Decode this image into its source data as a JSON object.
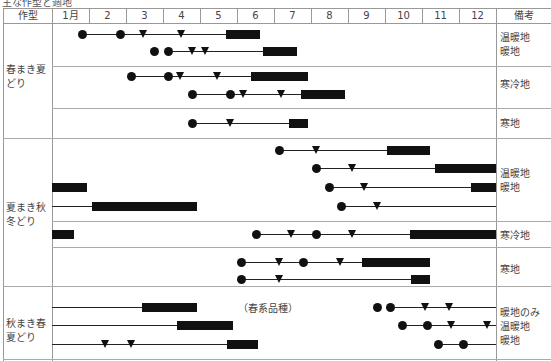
{
  "caption": "主な作型と適地",
  "header": {
    "type_col": "作型",
    "months": [
      "1月",
      "2",
      "3",
      "4",
      "5",
      "6",
      "7",
      "8",
      "9",
      "10",
      "11",
      "12"
    ],
    "notes_col": "備考"
  },
  "groups": [
    {
      "label_line1": "春まき夏",
      "label_line2": "どり"
    },
    {
      "label_line1": "夏まき秋",
      "label_line2": "冬どり"
    },
    {
      "label_line1": "秋まき春",
      "label_line2": "夏どり"
    }
  ],
  "notes": {
    "spring_warm": [
      "温暖地",
      "暖地"
    ],
    "spring_cold": "寒冷地",
    "spring_coldland": "寒地",
    "summer_warm": [
      "温暖地",
      "暖地"
    ],
    "summer_cold": "寒冷地",
    "summer_coldland": "寒地",
    "autumn": [
      "暖地のみ",
      "温暖地",
      "暖地"
    ]
  },
  "annotation": "（春系品種）",
  "chart_data": {
    "type": "table",
    "title": "主な作型と適地",
    "legend": {
      "●": "は種",
      "▼": "定植",
      "■": "収穫"
    },
    "columns": [
      "作型",
      "1月",
      "2",
      "3",
      "4",
      "5",
      "6",
      "7",
      "8",
      "9",
      "10",
      "11",
      "12",
      "備考"
    ],
    "rows": [
      {
        "group": "春まき夏どり",
        "region": "温暖地/暖地",
        "sow": [
          1.8,
          2.8
        ],
        "plant": [
          3.4,
          4.4
        ],
        "harvest": [
          5.6,
          6.5
        ]
      },
      {
        "group": "春まき夏どり",
        "region": "温暖地/暖地",
        "sow": [
          3.7,
          4.1
        ],
        "plant": [
          4.5,
          4.9
        ],
        "harvest": [
          6.6,
          7.5
        ]
      },
      {
        "group": "春まき夏どり",
        "region": "寒冷地",
        "sow": [
          3.3,
          4.3
        ],
        "plant": [
          4.6,
          5.6
        ],
        "harvest": [
          6.4,
          7.9
        ]
      },
      {
        "group": "春まき夏どり",
        "region": "寒冷地",
        "sow": [
          4.9,
          5.9
        ],
        "plant": [
          6.2,
          7.2
        ],
        "harvest": [
          7.7,
          8.9
        ]
      },
      {
        "group": "春まき夏どり",
        "region": "寒地",
        "sow": [
          4.9
        ],
        "plant": [
          5.9
        ],
        "harvest": [
          7.4,
          7.9
        ]
      },
      {
        "group": "夏まき秋冬どり",
        "region": "温暖地/暖地",
        "sow": [
          7.1
        ],
        "plant": [
          8.1
        ],
        "harvest": [
          10.0,
          11.1
        ]
      },
      {
        "group": "夏まき秋冬どり",
        "region": "温暖地/暖地",
        "sow": [
          8.1
        ],
        "plant": [
          9.0
        ],
        "harvest": [
          11.3,
          12.9
        ]
      },
      {
        "group": "夏まき秋冬どり",
        "region": "温暖地/暖地",
        "sow": [
          8.4
        ],
        "plant": [
          9.3
        ],
        "harvest": [
          12.3,
          12.9,
          1.0,
          1.9
        ]
      },
      {
        "group": "夏まき秋冬どり",
        "region": "温暖地/暖地",
        "sow": [
          8.7
        ],
        "plant": [
          9.6
        ],
        "harvest": [
          2.1,
          4.9
        ]
      },
      {
        "group": "夏まき秋冬どり",
        "region": "寒冷地",
        "sow": [
          6.3,
          7.9
        ],
        "plant": [
          7.3,
          8.9
        ],
        "harvest": [
          10.3,
          12.9,
          1.0,
          1.6
        ]
      },
      {
        "group": "夏まき秋冬どり",
        "region": "寒地",
        "sow": [
          6.0,
          7.5
        ],
        "plant": [
          6.9,
          8.4
        ],
        "harvest": [
          9.9,
          11.7
        ]
      },
      {
        "group": "夏まき秋冬どり",
        "region": "寒地",
        "sow": [
          6.0
        ],
        "plant": [
          6.9
        ],
        "harvest": [
          11.0,
          11.5
        ]
      },
      {
        "group": "秋まき春夏どり",
        "region": "暖地のみ",
        "sow": [
          9.7,
          10.1
        ],
        "plant": [
          10.8,
          11.4
        ],
        "harvest": [
          3.4,
          4.9
        ],
        "note": "（春系品種）"
      },
      {
        "group": "秋まき春夏どり",
        "region": "温暖地",
        "sow": [
          10.0,
          10.7
        ],
        "plant": [
          11.4,
          12.5
        ],
        "harvest": [
          4.3,
          5.9
        ]
      },
      {
        "group": "秋まき春夏どり",
        "region": "暖地",
        "sow": [
          11.1,
          11.7
        ],
        "plant": [
          2.4,
          3.1
        ],
        "harvest": [
          5.6,
          6.5
        ]
      }
    ]
  }
}
